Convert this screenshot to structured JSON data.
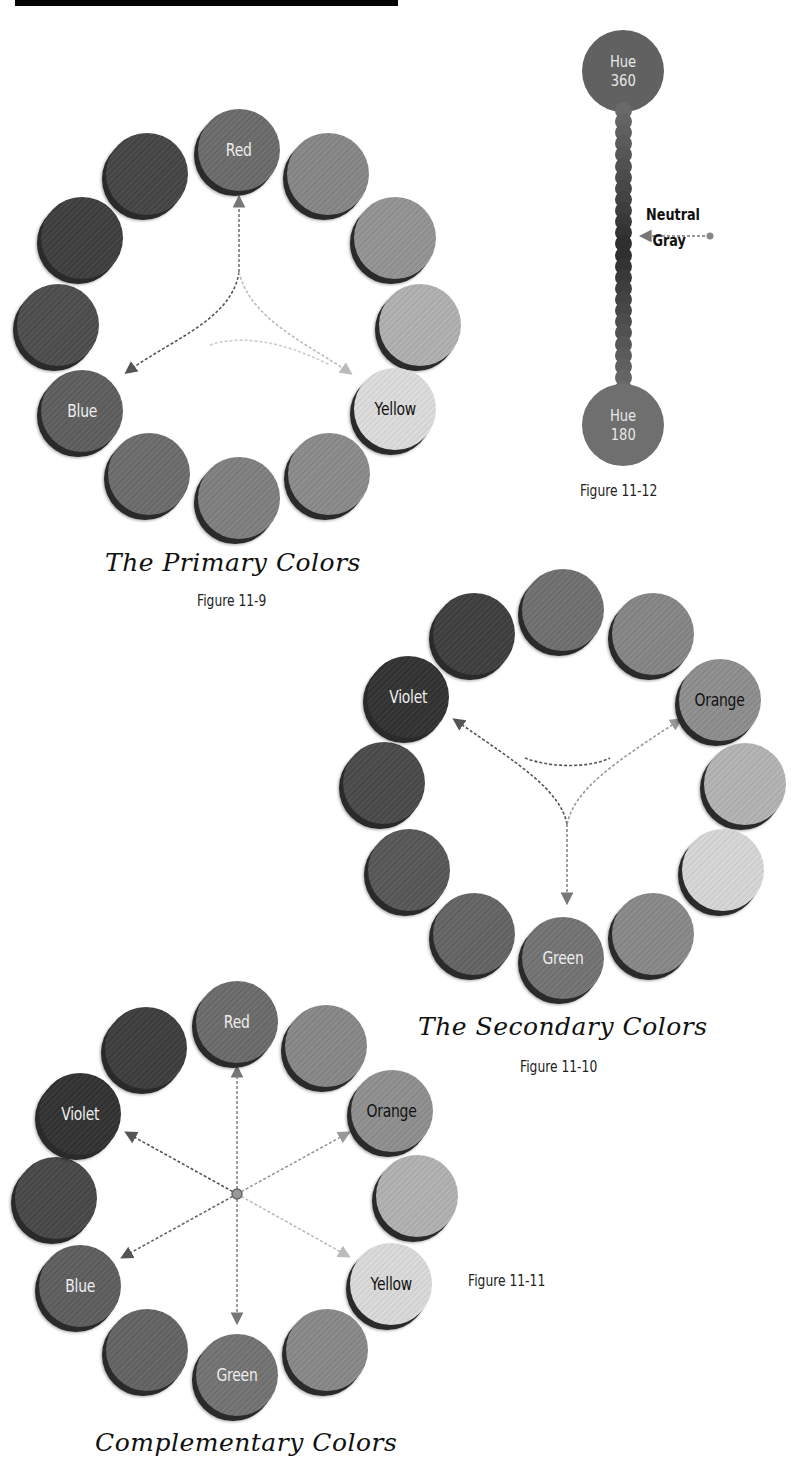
{
  "page": {
    "top_bar_color": "#050505",
    "background": "#ffffff"
  },
  "figures": {
    "primary": {
      "title": "The Primary Colors",
      "caption": "Figure 11-9",
      "labels": {
        "red": "Red",
        "yellow": "Yellow",
        "blue": "Blue"
      }
    },
    "hue_bar": {
      "caption": "Figure 11-12",
      "top_label_line1": "Hue",
      "top_label_line2": "360",
      "bottom_label_line1": "Hue",
      "bottom_label_line2": "180",
      "neutral_line1": "Neutral",
      "neutral_line2": "Gray"
    },
    "secondary": {
      "title": "The Secondary Colors",
      "caption": "Figure 11-10",
      "labels": {
        "orange": "Orange",
        "green": "Green",
        "violet": "Violet"
      }
    },
    "complementary": {
      "title": "Complementary Colors",
      "caption": "Figure 11-11",
      "labels": {
        "red": "Red",
        "orange": "Orange",
        "yellow": "Yellow",
        "green": "Green",
        "blue": "Blue",
        "violet": "Violet"
      }
    }
  },
  "wheel_tones": [
    "#5d5d5d",
    "#7a7a7a",
    "#8a8a8a",
    "#a6a6a6",
    "#d8d8d8",
    "#828282",
    "#6e6e6e",
    "#636363",
    "#545454",
    "#474747",
    "#3b3b3b",
    "#434343"
  ]
}
